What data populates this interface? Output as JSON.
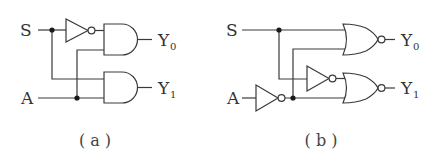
{
  "diagrams": [
    {
      "id": "a",
      "caption": "( a )",
      "inputs": {
        "s": "S",
        "a": "A"
      },
      "outputs": {
        "y0": {
          "letter": "Y",
          "sub": "0"
        },
        "y1": {
          "letter": "Y",
          "sub": "1"
        }
      },
      "gates": [
        "NOT",
        "AND",
        "AND"
      ]
    },
    {
      "id": "b",
      "caption": "( b )",
      "inputs": {
        "s": "S",
        "a": "A"
      },
      "outputs": {
        "y0": {
          "letter": "Y",
          "sub": "0"
        },
        "y1": {
          "letter": "Y",
          "sub": "1"
        }
      },
      "gates": [
        "NOT",
        "NOT",
        "NOR",
        "NOR"
      ]
    }
  ],
  "colors": {
    "line": "#3a3a3a",
    "text": "#333333",
    "background": "#ffffff"
  }
}
